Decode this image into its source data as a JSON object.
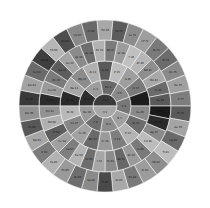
{
  "chart_data": {
    "type": "sunburst",
    "title": "",
    "center": [
      105,
      106
    ],
    "ring_radii": [
      [
        0,
        12
      ],
      [
        12,
        26
      ],
      [
        26,
        45
      ],
      [
        45,
        66
      ],
      [
        66,
        86
      ]
    ],
    "rings": [
      {
        "segments": [
          {
            "label": "He 2",
            "shade": "#3a3a3a"
          },
          {
            "label": "H 1",
            "shade": "#a8a8a8"
          }
        ]
      },
      {
        "segments": [
          {
            "label": "Ar 18",
            "shade": "#2e2e2e"
          },
          {
            "label": "Li 3",
            "shade": "#9c9c9c"
          },
          {
            "label": "Be 4",
            "shade": "#6a6a6a"
          },
          {
            "label": "B 5",
            "shade": "#8a8a8a"
          },
          {
            "label": "C 6",
            "shade": "#777777"
          },
          {
            "label": "N 7",
            "shade": "#a0a0a0"
          },
          {
            "label": "O 8",
            "shade": "#8e8e8e"
          },
          {
            "label": "F 9",
            "shade": "#6e6e6e"
          },
          {
            "label": "Ne 10",
            "shade": "#9a9a9a"
          }
        ]
      },
      {
        "segments": [
          {
            "label": "Kr 36",
            "shade": "#2a2a2a"
          },
          {
            "label": "Na 11",
            "shade": "#a6a6a6"
          },
          {
            "label": "Mg 12",
            "shade": "#8c8c8c"
          },
          {
            "label": "Al 13",
            "shade": "#b0b0b0"
          },
          {
            "label": "Si 14",
            "shade": "#5a5a5a"
          },
          {
            "label": "P 15",
            "shade": "#bdbdbd"
          },
          {
            "label": "S 16",
            "shade": "#9e9e9e"
          },
          {
            "label": "Cl 17",
            "shade": "#7a7a7a"
          },
          {
            "label": "K 19",
            "shade": "#1e1e1e"
          },
          {
            "label": "Ca 20",
            "shade": "#8a8a8a"
          },
          {
            "label": "Sc 21",
            "shade": "#6c6c6c"
          },
          {
            "label": "Ti 22",
            "shade": "#b4b4b4"
          },
          {
            "label": "V 23",
            "shade": "#7e7e7e"
          },
          {
            "label": "Cr 24",
            "shade": "#9a9a9a"
          },
          {
            "label": "Mn 25",
            "shade": "#6a6a6a"
          },
          {
            "label": "Fe 26",
            "shade": "#a2a2a2"
          },
          {
            "label": "Co 27",
            "shade": "#888888"
          },
          {
            "label": "Ni 28",
            "shade": "#b8b8b8"
          }
        ]
      },
      {
        "segments": [
          {
            "label": "Xe 54",
            "shade": "#2c2c2c"
          },
          {
            "label": "Cu 29",
            "shade": "#9a9a9a"
          },
          {
            "label": "Zn 30",
            "shade": "#7a7a7a"
          },
          {
            "label": "Ga 31",
            "shade": "#5c5c5c"
          },
          {
            "label": "Ge 32",
            "shade": "#a4a4a4"
          },
          {
            "label": "As 33",
            "shade": "#8a8a8a"
          },
          {
            "label": "Se 34",
            "shade": "#6e6e6e"
          },
          {
            "label": "Br 35",
            "shade": "#b2b2b2"
          },
          {
            "label": "Rb 37",
            "shade": "#7c7c7c"
          },
          {
            "label": "Sr 38",
            "shade": "#9c9c9c"
          },
          {
            "label": "Y 39",
            "shade": "#c0c0c0"
          },
          {
            "label": "Zr 40",
            "shade": "#b6b6b6"
          },
          {
            "label": "Nb 41",
            "shade": "#8e8e8e"
          },
          {
            "label": "Mo 42",
            "shade": "#a8a8a8"
          },
          {
            "label": "Tc 43",
            "shade": "#6a6a6a"
          },
          {
            "label": "Ru 44",
            "shade": "#5a5a5a"
          },
          {
            "label": "Rh 45",
            "shade": "#1a1a1a"
          },
          {
            "label": "Pd 46",
            "shade": "#2a2a2a"
          },
          {
            "label": "Ag 47",
            "shade": "#8a8a8a"
          },
          {
            "label": "Cd 48",
            "shade": "#bcbcbc"
          },
          {
            "label": "In 49",
            "shade": "#7a7a7a"
          },
          {
            "label": "Sn 50",
            "shade": "#9a9a9a"
          },
          {
            "label": "Sb 51",
            "shade": "#686868"
          },
          {
            "label": "Te 52",
            "shade": "#8c8c8c"
          },
          {
            "label": "I 53",
            "shade": "#a6a6a6"
          },
          {
            "label": "Cs 55",
            "shade": "#6e6e6e"
          },
          {
            "label": "Ba 56",
            "shade": "#b4b4b4"
          },
          {
            "label": "La 57",
            "shade": "#7e7e7e"
          },
          {
            "label": "Ce 58",
            "shade": "#a0a0a0"
          },
          {
            "label": "Pr 59",
            "shade": "#5e5e5e"
          },
          {
            "label": "Nd 60",
            "shade": "#b0b0b0"
          },
          {
            "label": "Pm 61",
            "shade": "#929292"
          }
        ]
      },
      {
        "segments": [
          {
            "label": "Rn 86",
            "shade": "#3a3a3a"
          },
          {
            "label": "Sm 62",
            "shade": "#a2a2a2"
          },
          {
            "label": "Eu 63",
            "shade": "#6a6a6a"
          },
          {
            "label": "Gd 64",
            "shade": "#3e3e3e"
          },
          {
            "label": "Tb 65",
            "shade": "#b6b6b6"
          },
          {
            "label": "Dy 66",
            "shade": "#4e4e4e"
          },
          {
            "label": "Ho 67",
            "shade": "#8a8a8a"
          },
          {
            "label": "Er 68",
            "shade": "#6a6a6a"
          },
          {
            "label": "Tm 69",
            "shade": "#a8a8a8"
          },
          {
            "label": "Yb 70",
            "shade": "#5c5c5c"
          },
          {
            "label": "Lu 71",
            "shade": "#8c8c8c"
          },
          {
            "label": "Hf 72",
            "shade": "#9e9e9e"
          },
          {
            "label": "Ta 73",
            "shade": "#7a7a7a"
          },
          {
            "label": "W 74",
            "shade": "#6c6c6c"
          },
          {
            "label": "Re 75",
            "shade": "#8a8a8a"
          },
          {
            "label": "Os 76",
            "shade": "#a0a0a0"
          },
          {
            "label": "Ir 77",
            "shade": "#7e7e7e"
          },
          {
            "label": "Pt 78",
            "shade": "#5a5a5a"
          },
          {
            "label": "Au 79",
            "shade": "#a4a4a4"
          },
          {
            "label": "Hg 80",
            "shade": "#6a6a6a"
          },
          {
            "label": "Tl 81",
            "shade": "#bdbdbd"
          },
          {
            "label": "Pb 82",
            "shade": "#8e8e8e"
          },
          {
            "label": "Bi 83",
            "shade": "#9c9c9c"
          },
          {
            "label": "Po 84",
            "shade": "#7a7a7a"
          },
          {
            "label": "At 85",
            "shade": "#a8a8a8"
          },
          {
            "label": "Fr 87",
            "shade": "#4a4a4a"
          },
          {
            "label": "Ra 88",
            "shade": "#8a8a8a"
          },
          {
            "label": "Ac 89",
            "shade": "#6e6e6e"
          },
          {
            "label": "Th 90",
            "shade": "#9a9a9a"
          },
          {
            "label": "Pa 91",
            "shade": "#b2b2b2"
          },
          {
            "label": "U 92",
            "shade": "#7c7c7c"
          },
          {
            "label": "Np 93",
            "shade": "#a6a6a6"
          },
          {
            "label": "Pu 94",
            "shade": "#585858"
          },
          {
            "label": "Am 95",
            "shade": "#929292"
          }
        ]
      }
    ]
  }
}
